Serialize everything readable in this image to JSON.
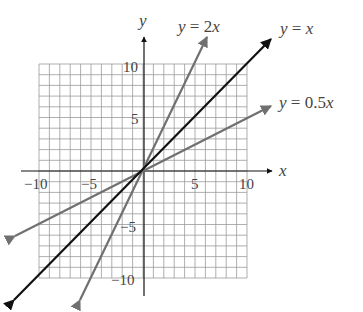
{
  "chart_data": {
    "type": "line",
    "title": "",
    "xlabel": "x",
    "ylabel": "y",
    "xlim": [
      -10,
      10
    ],
    "ylim": [
      -10,
      10
    ],
    "grid": true,
    "x_ticks": [
      "−10",
      "−5",
      "5",
      "10"
    ],
    "y_ticks": [
      "10",
      "5",
      "−5",
      "−10"
    ],
    "series": [
      {
        "name": "y = 2x",
        "slope": 2,
        "color": "#707070",
        "points": [
          [
            -6.2,
            -12.4
          ],
          [
            3.1,
            6.2
          ],
          [
            0,
            0
          ]
        ]
      },
      {
        "name": "y = x",
        "slope": 1,
        "color": "#111111",
        "points": [
          [
            -12.4,
            -12.4
          ],
          [
            12.4,
            12.4
          ],
          [
            0,
            0
          ]
        ]
      },
      {
        "name": "y = 0.5x",
        "slope": 0.5,
        "color": "#707070",
        "points": [
          [
            -12.4,
            -6.2
          ],
          [
            12.4,
            6.2
          ],
          [
            0,
            0
          ]
        ]
      }
    ],
    "legend_position": "inline labels at upper-right arrow ends"
  },
  "labels": {
    "x_axis": "x",
    "y_axis": "y",
    "line_2x": "y = 2x",
    "line_x": "y = x",
    "line_05x": "y = 0.5x",
    "tick_x_neg10": "−10",
    "tick_x_neg5": "−5",
    "tick_x_5": "5",
    "tick_x_10": "10",
    "tick_y_10": "10",
    "tick_y_5": "5",
    "tick_y_neg5": "−5",
    "tick_y_neg10": "−10"
  }
}
